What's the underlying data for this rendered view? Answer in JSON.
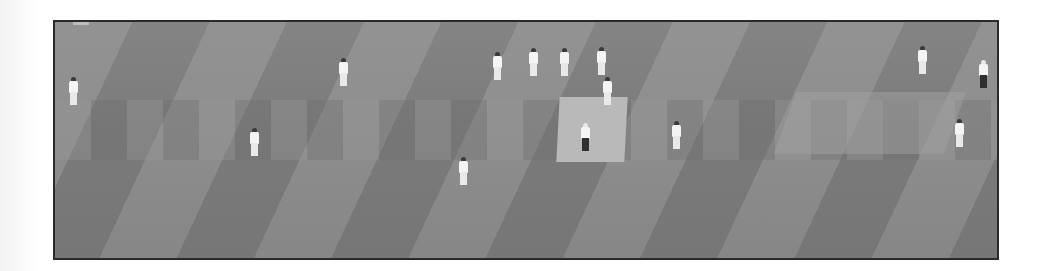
{
  "image": {
    "description": "Grayscale elevated view of a cricket match with fielders, bowler, batsmen and umpire on a striped outfield",
    "frame_border_color": "#2a2a2a",
    "field_colors": {
      "light_stripe": "#8e8e8e",
      "dark_stripe": "#7b7b7b",
      "pitch": "#b9b9b9"
    },
    "players": [
      {
        "role": "fielder",
        "x": 14,
        "y": 55
      },
      {
        "role": "fielder",
        "x": 284,
        "y": 36
      },
      {
        "role": "fielder",
        "x": 195,
        "y": 106
      },
      {
        "role": "slip-fielder",
        "x": 438,
        "y": 30
      },
      {
        "role": "slip-fielder",
        "x": 474,
        "y": 26
      },
      {
        "role": "slip-fielder",
        "x": 505,
        "y": 26
      },
      {
        "role": "wicket-keeper",
        "x": 542,
        "y": 25
      },
      {
        "role": "batsman",
        "x": 548,
        "y": 55
      },
      {
        "role": "umpire",
        "x": 526,
        "y": 101
      },
      {
        "role": "non-striker",
        "x": 617,
        "y": 99
      },
      {
        "role": "bowler",
        "x": 404,
        "y": 135
      },
      {
        "role": "fielder",
        "x": 863,
        "y": 24
      },
      {
        "role": "fielder",
        "x": 924,
        "y": 38
      },
      {
        "role": "fielder",
        "x": 900,
        "y": 97
      }
    ]
  }
}
